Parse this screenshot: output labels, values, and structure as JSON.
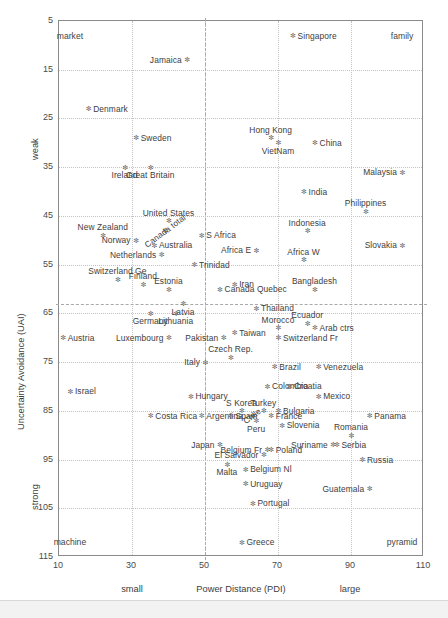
{
  "chart_data": {
    "type": "scatter",
    "title": "",
    "xlabel": "Power Distance (PDI)",
    "ylabel": "Uncertainty Avoidance (UAI)",
    "xlim": [
      10,
      110
    ],
    "ylim": [
      5,
      115
    ],
    "y_inverted": true,
    "xticks": [
      10,
      30,
      50,
      70,
      90,
      110
    ],
    "yticks": [
      5,
      15,
      25,
      35,
      45,
      55,
      65,
      75,
      85,
      95,
      105,
      115
    ],
    "grid": true,
    "legend": "none",
    "x_axis_low_label": "small",
    "x_axis_high_label": "large",
    "y_axis_low_label": "weak",
    "y_axis_high_label": "strong",
    "quadrant_labels": [
      {
        "text": "market",
        "x": 13,
        "y": 8,
        "corner": "top-left"
      },
      {
        "text": "family",
        "x": 104,
        "y": 8,
        "corner": "top-right"
      },
      {
        "text": "machine",
        "x": 13,
        "y": 112,
        "corner": "bottom-left"
      },
      {
        "text": "pyramid",
        "x": 104,
        "y": 112,
        "corner": "bottom-right"
      }
    ],
    "dividers": {
      "vertical_x": 50,
      "horizontal_y": 63
    },
    "points": [
      {
        "label": "Jamaica",
        "x": 45,
        "y": 13,
        "pos": "l"
      },
      {
        "label": "Singapore",
        "x": 74,
        "y": 8,
        "pos": "r"
      },
      {
        "label": "Denmark",
        "x": 18,
        "y": 23,
        "pos": "r"
      },
      {
        "label": "Sweden",
        "x": 31,
        "y": 29,
        "pos": "r"
      },
      {
        "label": "Hong Kong",
        "x": 68,
        "y": 29,
        "pos": "above"
      },
      {
        "label": "VietNam",
        "x": 70,
        "y": 30,
        "pos": "below"
      },
      {
        "label": "China",
        "x": 80,
        "y": 30,
        "pos": "r"
      },
      {
        "label": "Ireland",
        "x": 28,
        "y": 35,
        "pos": "below"
      },
      {
        "label": "Great Britain",
        "x": 35,
        "y": 35,
        "pos": "below"
      },
      {
        "label": "Malaysia",
        "x": 104,
        "y": 36,
        "pos": "l"
      },
      {
        "label": "India",
        "x": 77,
        "y": 40,
        "pos": "r"
      },
      {
        "label": "Philippines",
        "x": 94,
        "y": 44,
        "pos": "above"
      },
      {
        "label": "Canada total",
        "x": 39,
        "y": 48,
        "pos": "rot"
      },
      {
        "label": "United States",
        "x": 40,
        "y": 46,
        "pos": "above"
      },
      {
        "label": "New Zealand",
        "x": 22,
        "y": 49,
        "pos": "above"
      },
      {
        "label": "Norway",
        "x": 31,
        "y": 50,
        "pos": "l"
      },
      {
        "label": "S Africa",
        "x": 49,
        "y": 49,
        "pos": "r"
      },
      {
        "label": "Indonesia",
        "x": 78,
        "y": 48,
        "pos": "above"
      },
      {
        "label": "Australia",
        "x": 36,
        "y": 51,
        "pos": "r"
      },
      {
        "label": "Africa E",
        "x": 64,
        "y": 52,
        "pos": "l"
      },
      {
        "label": "Slovakia",
        "x": 104,
        "y": 51,
        "pos": "l"
      },
      {
        "label": "Netherlands",
        "x": 38,
        "y": 53,
        "pos": "l"
      },
      {
        "label": "Africa W",
        "x": 77,
        "y": 54,
        "pos": "above"
      },
      {
        "label": "Trinidad",
        "x": 47,
        "y": 55,
        "pos": "r"
      },
      {
        "label": "Switzerland Ge",
        "x": 26,
        "y": 58,
        "pos": "above"
      },
      {
        "label": "Finland",
        "x": 33,
        "y": 59,
        "pos": "above"
      },
      {
        "label": "Estonia",
        "x": 40,
        "y": 60,
        "pos": "above"
      },
      {
        "label": "Iran",
        "x": 58,
        "y": 59,
        "pos": "r"
      },
      {
        "label": "Bangladesh",
        "x": 80,
        "y": 60,
        "pos": "above"
      },
      {
        "label": "Latvia",
        "x": 44,
        "y": 63,
        "pos": "below"
      },
      {
        "label": "Canada Quebec",
        "x": 54,
        "y": 60,
        "pos": "r"
      },
      {
        "label": "Thailand",
        "x": 64,
        "y": 64,
        "pos": "r"
      },
      {
        "label": "Germany",
        "x": 35,
        "y": 65,
        "pos": "below"
      },
      {
        "label": "Lithuania",
        "x": 42,
        "y": 65,
        "pos": "below"
      },
      {
        "label": "Morocco",
        "x": 70,
        "y": 68,
        "pos": "above"
      },
      {
        "label": "Ecuador",
        "x": 78,
        "y": 67,
        "pos": "above"
      },
      {
        "label": "Arab ctrs",
        "x": 80,
        "y": 68,
        "pos": "r"
      },
      {
        "label": "Austria",
        "x": 11,
        "y": 70,
        "pos": "r"
      },
      {
        "label": "Luxembourg",
        "x": 40,
        "y": 70,
        "pos": "l"
      },
      {
        "label": "Pakistan",
        "x": 55,
        "y": 70,
        "pos": "l"
      },
      {
        "label": "Taiwan",
        "x": 58,
        "y": 69,
        "pos": "r"
      },
      {
        "label": "Switzerland Fr",
        "x": 70,
        "y": 70,
        "pos": "r"
      },
      {
        "label": "Czech Rep.",
        "x": 57,
        "y": 74,
        "pos": "above"
      },
      {
        "label": "Italy",
        "x": 50,
        "y": 75,
        "pos": "l"
      },
      {
        "label": "Brazil",
        "x": 69,
        "y": 76,
        "pos": "r"
      },
      {
        "label": "Venezuela",
        "x": 81,
        "y": 76,
        "pos": "r"
      },
      {
        "label": "Israel",
        "x": 13,
        "y": 81,
        "pos": "r"
      },
      {
        "label": "Colombia",
        "x": 67,
        "y": 80,
        "pos": "r"
      },
      {
        "label": "Croatia",
        "x": 73,
        "y": 80,
        "pos": "r"
      },
      {
        "label": "Hungary",
        "x": 46,
        "y": 82,
        "pos": "r"
      },
      {
        "label": "Mexico",
        "x": 81,
        "y": 82,
        "pos": "r"
      },
      {
        "label": "S Korea",
        "x": 60,
        "y": 85,
        "pos": "above"
      },
      {
        "label": "Costa Rica",
        "x": 35,
        "y": 86,
        "pos": "r"
      },
      {
        "label": "Turkey",
        "x": 66,
        "y": 85,
        "pos": "above"
      },
      {
        "label": "Argentina",
        "x": 49,
        "y": 86,
        "pos": "r"
      },
      {
        "label": "Spain",
        "x": 57,
        "y": 86,
        "pos": "r"
      },
      {
        "label": "Bulgaria",
        "x": 70,
        "y": 85,
        "pos": "r"
      },
      {
        "label": "Panama",
        "x": 95,
        "y": 86,
        "pos": "r"
      },
      {
        "label": "Chile",
        "x": 63,
        "y": 86,
        "pos": "rot"
      },
      {
        "label": "Peru",
        "x": 64,
        "y": 87,
        "pos": "below"
      },
      {
        "label": "France",
        "x": 68,
        "y": 86,
        "pos": "r"
      },
      {
        "label": "Slovenia",
        "x": 71,
        "y": 88,
        "pos": "r"
      },
      {
        "label": "Romania",
        "x": 90,
        "y": 90,
        "pos": "above"
      },
      {
        "label": "Japan",
        "x": 54,
        "y": 92,
        "pos": "l"
      },
      {
        "label": "Belgium Fr",
        "x": 67,
        "y": 93,
        "pos": "l"
      },
      {
        "label": "Suriname",
        "x": 85,
        "y": 92,
        "pos": "l"
      },
      {
        "label": "Serbia",
        "x": 86,
        "y": 92,
        "pos": "r"
      },
      {
        "label": "El Salvador",
        "x": 66,
        "y": 94,
        "pos": "l"
      },
      {
        "label": "Poland",
        "x": 68,
        "y": 93,
        "pos": "r"
      },
      {
        "label": "Russia",
        "x": 93,
        "y": 95,
        "pos": "r"
      },
      {
        "label": "Malta",
        "x": 56,
        "y": 96,
        "pos": "below"
      },
      {
        "label": "Belgium Nl",
        "x": 61,
        "y": 97,
        "pos": "r"
      },
      {
        "label": "Uruguay",
        "x": 61,
        "y": 100,
        "pos": "r"
      },
      {
        "label": "Guatemala",
        "x": 95,
        "y": 101,
        "pos": "l"
      },
      {
        "label": "Portugal",
        "x": 63,
        "y": 104,
        "pos": "r"
      },
      {
        "label": "Greece",
        "x": 60,
        "y": 112,
        "pos": "r"
      }
    ]
  }
}
